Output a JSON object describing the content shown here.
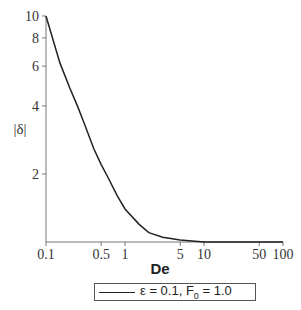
{
  "chart_data": {
    "type": "line",
    "title": "",
    "xlabel": "De",
    "ylabel": "|δ|",
    "xscale": "log",
    "yscale": "log",
    "xlim": [
      0.1,
      100
    ],
    "ylim": [
      1,
      10
    ],
    "x_ticks": [
      "0.1",
      "0.5",
      "1",
      "5",
      "10",
      "50",
      "100"
    ],
    "y_ticks": [
      "2",
      "4",
      "6",
      "8",
      "10"
    ],
    "grid": false,
    "legend_position": "bottom",
    "series": [
      {
        "name": "ε = 0.1, F0 = 1.0",
        "x": [
          0.1,
          0.15,
          0.2,
          0.25,
          0.3,
          0.4,
          0.5,
          0.6,
          0.8,
          1,
          1.5,
          2,
          3,
          5,
          10,
          20,
          50,
          100
        ],
        "values": [
          10,
          6.2,
          4.8,
          4.0,
          3.4,
          2.6,
          2.2,
          1.95,
          1.6,
          1.4,
          1.2,
          1.1,
          1.05,
          1.02,
          1.0,
          1.0,
          1.0,
          1.0
        ]
      }
    ]
  },
  "legend": {
    "text_prefix": "ε = 0.1, F",
    "subscript": "0",
    "text_suffix": " = 1.0"
  }
}
